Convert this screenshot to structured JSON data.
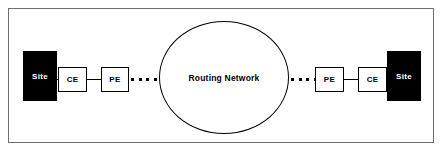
{
  "diagram": {
    "frame": {
      "border_color": "#6e6e6e",
      "background": "#ffffff"
    },
    "cloud": {
      "label": "Routing Network",
      "fill": "#ffffff",
      "stroke": "#000000"
    },
    "nodes": [
      {
        "id": "site-left",
        "label": "Site",
        "kind": "site",
        "fill": "#000000",
        "text_color": "#ffffff"
      },
      {
        "id": "ce-left",
        "label": "CE",
        "kind": "edge",
        "fill": "#ffffff",
        "text_color": "#000000"
      },
      {
        "id": "pe-left",
        "label": "PE",
        "kind": "edge",
        "fill": "#ffffff",
        "text_color": "#000000"
      },
      {
        "id": "pe-right",
        "label": "PE",
        "kind": "edge",
        "fill": "#ffffff",
        "text_color": "#000000"
      },
      {
        "id": "ce-right",
        "label": "CE",
        "kind": "edge",
        "fill": "#ffffff",
        "text_color": "#000000"
      },
      {
        "id": "site-right",
        "label": "Site",
        "kind": "site",
        "fill": "#000000",
        "text_color": "#ffffff"
      }
    ],
    "links": [
      {
        "id": "site-left-ce-left",
        "style": "solid",
        "dots": 0
      },
      {
        "id": "ce-left-pe-left",
        "style": "solid",
        "dots": 0
      },
      {
        "id": "pe-left-cloud",
        "style": "dotted",
        "dots": 4
      },
      {
        "id": "cloud-pe-right",
        "style": "dotted",
        "dots": 4
      },
      {
        "id": "pe-right-ce-right",
        "style": "solid",
        "dots": 0
      },
      {
        "id": "ce-right-site-right",
        "style": "solid",
        "dots": 0
      }
    ]
  }
}
